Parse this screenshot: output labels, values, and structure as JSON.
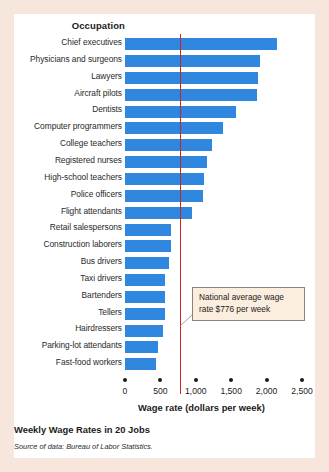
{
  "figure": {
    "column_header": "Occupation",
    "caption": "Weekly Wage Rates in 20 Jobs",
    "source": "Source of data: Bureau of Labor Statistics.",
    "annotation": "National average wage rate $776 per week",
    "bar_color": "#2f87e0",
    "average_line_color": "#d0202a",
    "annotation_bg": "#fbeedf",
    "page_bg": "#f6e6dc"
  },
  "chart_data": {
    "type": "bar",
    "orientation": "horizontal",
    "title": "Weekly Wage Rates in 20 Jobs",
    "xlabel": "Wage rate (dollars per week)",
    "ylabel": "Occupation",
    "xlim": [
      0,
      2500
    ],
    "xticks": [
      0,
      500,
      1000,
      1500,
      2000,
      2500
    ],
    "xticklabels": [
      "0",
      "500",
      "1,000",
      "1,500",
      "2,000",
      "2,500"
    ],
    "grid": false,
    "legend": false,
    "annotations": [
      {
        "text": "National average wage rate $776 per week",
        "value": 776,
        "type": "vertical-reference-line"
      }
    ],
    "categories": [
      "Chief executives",
      "Physicians and surgeons",
      "Lawyers",
      "Aircraft pilots",
      "Dentists",
      "Computer programmers",
      "College teachers",
      "Registered nurses",
      "High-school teachers",
      "Police officers",
      "Flight attendants",
      "Retail salespersons",
      "Construction laborers",
      "Bus drivers",
      "Taxi drivers",
      "Bartenders",
      "Tellers",
      "Hairdressers",
      "Parking-lot attendants",
      "Fast-food workers"
    ],
    "values": [
      2150,
      1900,
      1880,
      1860,
      1570,
      1380,
      1230,
      1160,
      1110,
      1100,
      940,
      650,
      650,
      620,
      570,
      570,
      560,
      540,
      470,
      440
    ]
  }
}
